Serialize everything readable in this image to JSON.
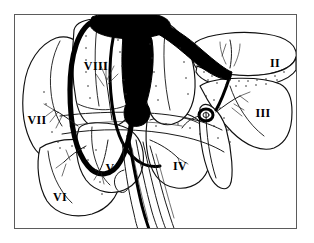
{
  "figure": {
    "border_color": "#5b5b5b",
    "ink_color": "#000000",
    "background_color": "#ffffff"
  },
  "segments": [
    {
      "id": "segment-1",
      "label": "I",
      "name": "caudate lobe",
      "x": 137,
      "y": 99,
      "anchor": "middle"
    },
    {
      "id": "segment-2",
      "label": "II",
      "name": "left lateral superior",
      "x": 275,
      "y": 63,
      "anchor": "middle"
    },
    {
      "id": "segment-3",
      "label": "III",
      "name": "left lateral inferior",
      "x": 263,
      "y": 113,
      "anchor": "middle"
    },
    {
      "id": "segment-4",
      "label": "IV",
      "name": "left medial",
      "x": 180,
      "y": 166,
      "anchor": "middle"
    },
    {
      "id": "segment-5",
      "label": "V",
      "name": "right anterior inferior",
      "x": 110,
      "y": 168,
      "anchor": "middle"
    },
    {
      "id": "segment-6",
      "label": "VI",
      "name": "right posterior inferior",
      "x": 60,
      "y": 197,
      "anchor": "middle"
    },
    {
      "id": "segment-7",
      "label": "VII",
      "name": "right posterior superior",
      "x": 37,
      "y": 120,
      "anchor": "middle"
    },
    {
      "id": "segment-8",
      "label": "VIII",
      "name": "right anterior superior",
      "x": 96,
      "y": 66,
      "anchor": "middle"
    }
  ],
  "vessels": [
    {
      "id": "vena-cava",
      "label": "inferior vena cava"
    },
    {
      "id": "right-hepatic-vein",
      "label": "right hepatic vein"
    },
    {
      "id": "middle-hepatic-vein",
      "label": "middle hepatic vein"
    },
    {
      "id": "left-hepatic-vein",
      "label": "left hepatic vein"
    },
    {
      "id": "portal-vein",
      "label": "portal vein"
    },
    {
      "id": "hepatic-artery",
      "label": "hepatic artery"
    },
    {
      "id": "bile-duct",
      "label": "bile duct"
    }
  ]
}
